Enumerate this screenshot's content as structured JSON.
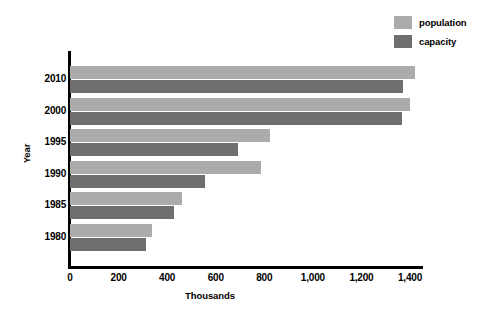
{
  "chart_data": {
    "type": "bar",
    "orientation": "horizontal",
    "title": "",
    "xlabel": "Thousands",
    "ylabel": "Year",
    "categories": [
      "2010",
      "2000",
      "1995",
      "1990",
      "1985",
      "1980"
    ],
    "series": [
      {
        "name": "population",
        "color": "#ababab",
        "values": [
          1420,
          1400,
          825,
          786,
          460,
          338
        ]
      },
      {
        "name": "capacity",
        "color": "#6e6e6e",
        "values": [
          1370,
          1366,
          690,
          556,
          430,
          313
        ]
      }
    ],
    "xlim": [
      0,
      1400
    ],
    "x_ticks": [
      0,
      200,
      400,
      600,
      800,
      1000,
      1200,
      1400
    ],
    "x_tick_labels": [
      "0",
      "200",
      "400",
      "600",
      "800",
      "1,000",
      "1,200",
      "1,400"
    ],
    "grid": false,
    "legend_position": "top-right",
    "axis_color": "#000000",
    "background": "#ffffff"
  },
  "legend": {
    "entries": [
      {
        "label": "population",
        "color": "#ababab"
      },
      {
        "label": "capacity",
        "color": "#6e6e6e"
      }
    ]
  }
}
